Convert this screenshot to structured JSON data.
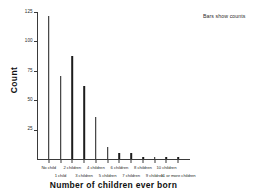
{
  "chart_data": {
    "type": "bar",
    "title": "",
    "subtitle": "",
    "annotation": "Bars show counts",
    "xlabel": "Number of children ever born",
    "ylabel": "Count",
    "categories": [
      "No child",
      "1 child",
      "2 children",
      "3 children",
      "4 children",
      "5 children",
      "6 children",
      "7 children",
      "8 children",
      "9 children",
      "10 children",
      "11 or more children"
    ],
    "values": [
      122,
      71,
      88,
      62,
      36,
      10,
      5,
      5,
      2,
      2,
      2,
      2
    ],
    "ylim": [
      0,
      125
    ],
    "yticks": [
      25,
      50,
      75,
      100,
      125
    ],
    "ytick_labels": [
      "25",
      "50",
      "75",
      "100",
      "125"
    ],
    "grid": false,
    "legend": "none",
    "bar_color": "#1c1c1c",
    "axis_color": "#3a3a3a",
    "background": "#ffffff"
  }
}
